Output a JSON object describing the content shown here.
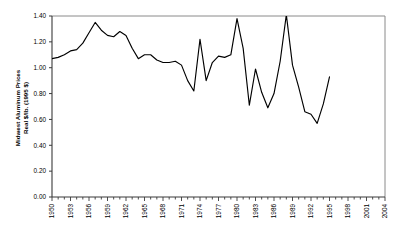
{
  "chart_data": {
    "type": "line",
    "title": "",
    "xlabel": "",
    "ylabel_line1": "Midwest Aluminum Prices",
    "ylabel_line2": "Real $/lb. (1995 $)",
    "xlim": [
      1950,
      2004
    ],
    "ylim": [
      0.0,
      1.4
    ],
    "grid": false,
    "legend": "none",
    "y_ticks": [
      "0.00",
      "0.20",
      "0.40",
      "0.60",
      "0.80",
      "1.00",
      "1.20",
      "1.40"
    ],
    "y_tick_values": [
      0.0,
      0.2,
      0.4,
      0.6,
      0.8,
      1.0,
      1.2,
      1.4
    ],
    "x_tick_labels": [
      "1950",
      "1953",
      "1956",
      "1959",
      "1962",
      "1965",
      "1968",
      "1971",
      "1974",
      "1977",
      "1980",
      "1983",
      "1986",
      "1989",
      "1992",
      "1995",
      "1998",
      "2001",
      "2004"
    ],
    "x_tick_label_values": [
      1950,
      1953,
      1956,
      1959,
      1962,
      1965,
      1968,
      1971,
      1974,
      1977,
      1980,
      1983,
      1986,
      1989,
      1992,
      1995,
      1998,
      2001,
      2004
    ],
    "x_minor_tick_step": 1,
    "line_color": "#000000",
    "frame_color": "#808080",
    "background_color": "#ffffff",
    "series": [
      {
        "name": "Midwest Aluminum Price",
        "x": [
          1950,
          1951,
          1952,
          1953,
          1954,
          1955,
          1956,
          1957,
          1958,
          1959,
          1960,
          1961,
          1962,
          1963,
          1964,
          1965,
          1966,
          1967,
          1968,
          1969,
          1970,
          1971,
          1972,
          1973,
          1974,
          1975,
          1976,
          1977,
          1978,
          1979,
          1980,
          1981,
          1982,
          1983,
          1984,
          1985,
          1986,
          1987,
          1988,
          1989,
          1990,
          1991,
          1992,
          1993,
          1994,
          1995
        ],
        "values": [
          1.07,
          1.08,
          1.1,
          1.13,
          1.14,
          1.19,
          1.27,
          1.35,
          1.29,
          1.25,
          1.24,
          1.28,
          1.25,
          1.15,
          1.07,
          1.1,
          1.1,
          1.06,
          1.04,
          1.04,
          1.05,
          1.02,
          0.9,
          0.82,
          1.22,
          0.9,
          1.04,
          1.09,
          1.08,
          1.1,
          1.38,
          1.15,
          0.71,
          0.99,
          0.81,
          0.69,
          0.8,
          1.05,
          1.41,
          1.02,
          0.85,
          0.66,
          0.64,
          0.57,
          0.72,
          0.93
        ]
      }
    ]
  }
}
